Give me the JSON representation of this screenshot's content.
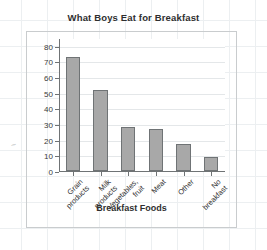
{
  "chart_data": {
    "type": "bar",
    "title": "What Boys Eat for Breakfast",
    "xlabel": "Breakfast Foods",
    "ylabel": "Number of Boys",
    "categories": [
      "Grain\nproducts",
      "Milk\nproducts",
      "Vegetables,\nfruit",
      "Meat",
      "Other",
      "No\nbreakfast"
    ],
    "values": [
      73,
      52,
      28,
      27,
      17,
      9
    ],
    "ylim": [
      0,
      85
    ],
    "yticks": [
      0,
      10,
      20,
      30,
      40,
      50,
      60,
      70,
      80
    ],
    "ytick_labels": [
      "0",
      "10",
      "20",
      "30",
      "40",
      "50",
      "60",
      "70",
      "80"
    ],
    "grid": true,
    "legend": "none",
    "bar_color": "#a8a8a8",
    "bar_border_color": "#6f7375",
    "axis_color": "#6f7375",
    "grid_color": "#e4e7e9",
    "text_color": "#2f2f2f"
  },
  "annotations": {
    "stray_mark": "~"
  }
}
